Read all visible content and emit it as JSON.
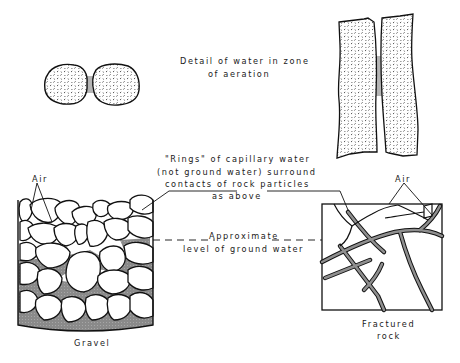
{
  "figure": {
    "detail_caption": {
      "line1": "Detail of water in zone",
      "line2": "of aeration"
    },
    "rings_caption": {
      "line1": "\"Rings\" of capillary water",
      "line2": "(not ground water) surround",
      "line3": "contacts of rock particles",
      "line4": "as above"
    },
    "groundwater_caption": {
      "line1": "Approximate",
      "line2": "level of ground water"
    },
    "air_left": "Air",
    "air_right": "Air",
    "gravel_label": "Gravel",
    "fractured_label": {
      "line1": "Fractured",
      "line2": "rock"
    },
    "colors": {
      "ink": "#1a1a1a",
      "water": "#8c8c8c",
      "capillary": "#b0b0b0",
      "background": "#ffffff"
    }
  }
}
